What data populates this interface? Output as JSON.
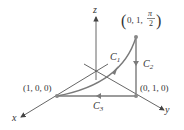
{
  "axes": {
    "x_label": "x",
    "y_label": "y",
    "z_label": "z"
  },
  "points": {
    "top": {
      "open": "(",
      "coords": "0, 1,",
      "frac_num": "π",
      "frac_den": "2",
      "close": ")"
    },
    "left": {
      "label": "(1, 0, 0)"
    },
    "right": {
      "label": "(0, 1, 0)"
    }
  },
  "curves": {
    "c1": {
      "name": "C",
      "sub": "1"
    },
    "c2": {
      "name": "C",
      "sub": "2"
    },
    "c3": {
      "name": "C",
      "sub": "3"
    }
  },
  "colors": {
    "axis": "#555555",
    "curve": "#7a7a7a",
    "point": "#888888",
    "text": "#333333"
  }
}
